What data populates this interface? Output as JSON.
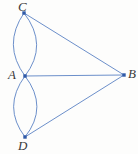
{
  "figure": {
    "width": 138,
    "height": 154,
    "background_color": "#fdfdfc"
  },
  "style": {
    "edge_color": "#5b82c4",
    "edge_width": 0.9,
    "vertex_color": "#2f5aa8",
    "vertex_size": 3.4,
    "label_color": "#3a3a3a"
  },
  "graph_data": {
    "type": "multigraph",
    "vertices": [
      {
        "id": "C",
        "label": "C",
        "x": 24,
        "y": 13,
        "label_position": "above"
      },
      {
        "id": "A",
        "label": "A",
        "x": 25,
        "y": 76,
        "label_position": "left"
      },
      {
        "id": "B",
        "label": "B",
        "x": 124,
        "y": 75,
        "label_position": "right"
      },
      {
        "id": "D",
        "label": "D",
        "x": 25,
        "y": 137,
        "label_position": "below"
      }
    ],
    "edges": [
      {
        "from": "A",
        "to": "C",
        "shape": "curve",
        "bulge": "left",
        "control_x": 2,
        "control_y": 45
      },
      {
        "from": "A",
        "to": "C",
        "shape": "curve",
        "bulge": "right",
        "control_x": 49,
        "control_y": 45
      },
      {
        "from": "A",
        "to": "D",
        "shape": "curve",
        "bulge": "left",
        "control_x": 2,
        "control_y": 107
      },
      {
        "from": "A",
        "to": "D",
        "shape": "curve",
        "bulge": "right",
        "control_x": 49,
        "control_y": 107
      },
      {
        "from": "A",
        "to": "B",
        "shape": "straight"
      },
      {
        "from": "C",
        "to": "B",
        "shape": "straight"
      },
      {
        "from": "D",
        "to": "B",
        "shape": "straight"
      }
    ],
    "edge_count": 7,
    "vertex_count": 4
  }
}
